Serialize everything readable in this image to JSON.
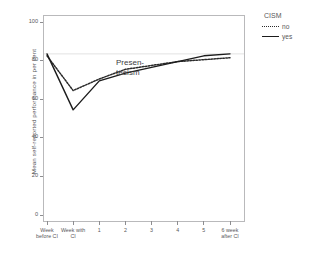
{
  "chart_data": {
    "type": "line",
    "title": "",
    "xlabel": "",
    "ylabel": "Mean self-reported performance in per cent",
    "ylim": [
      0,
      100
    ],
    "yticks": [
      0,
      20,
      40,
      60,
      80,
      100
    ],
    "ytick_labels": [
      "0",
      "20",
      "40",
      "60",
      "80",
      "100"
    ],
    "grid": false,
    "legend_position": "right",
    "legend_title": "CISM",
    "categories": [
      "Week before CI",
      "Week with CI",
      "1",
      "2",
      "3",
      "4",
      "5",
      "6 week after CI"
    ],
    "category_lines": [
      [
        "Week",
        "before CI"
      ],
      [
        "Week with",
        "CI"
      ],
      [
        "1"
      ],
      [
        "2"
      ],
      [
        "3"
      ],
      [
        "4"
      ],
      [
        "5"
      ],
      [
        "6 week",
        "after CI"
      ]
    ],
    "series": [
      {
        "name": "no",
        "style": "dotted",
        "color": "#2b2b2b",
        "values": [
          83,
          65,
          71,
          76,
          78,
          80,
          81,
          82
        ]
      },
      {
        "name": "yes",
        "style": "solid",
        "color": "#1c1c1c",
        "values": [
          84,
          55,
          70,
          74,
          77,
          80,
          83,
          84
        ]
      }
    ],
    "annotations": [
      {
        "name": "presenteeism",
        "text": "Presen-teeism",
        "lines": [
          "Presen-",
          "teeism"
        ]
      }
    ],
    "reference_line": {
      "value": 84,
      "color": "#d9d9d9"
    }
  },
  "axes": {
    "y_title": "Mean self-reported performance in per cent"
  },
  "legend": {
    "title": "CISM",
    "entries": [
      {
        "label": "no",
        "style": "dotted"
      },
      {
        "label": "yes",
        "style": "solid"
      }
    ]
  }
}
